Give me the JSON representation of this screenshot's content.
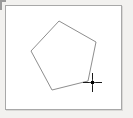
{
  "app": {
    "title": "Shape Canvas",
    "background_color": "#f2f1ef"
  },
  "canvas": {
    "name": "drawing-canvas",
    "fill_color": "#ffffff",
    "border_color": "#a8a8a8",
    "x": 5,
    "y": 5,
    "width": 117,
    "height": 105
  },
  "corner_tick": {
    "label": "",
    "color": "#9a9a9a"
  },
  "shapes": [
    {
      "name": "pentagon",
      "type": "polygon",
      "stroke_color": "#8e8e8e",
      "stroke_width": 1,
      "fill": "none",
      "points": "59,21 96,42 88,81 52,90 31,51"
    }
  ],
  "cursor": {
    "type": "crosshair",
    "color": "#1a1a1a",
    "x": 92,
    "y": 82
  }
}
